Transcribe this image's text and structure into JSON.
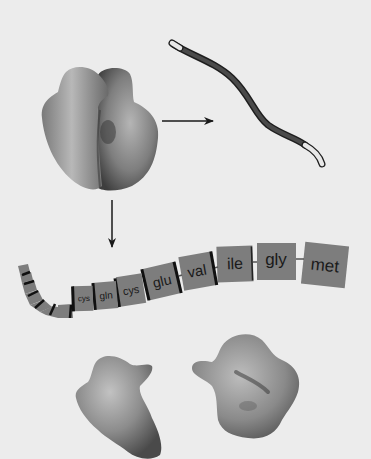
{
  "figure": {
    "colors": {
      "background": "#ececec",
      "blob_fill": "#8a8a8a",
      "strand_dark": "#2e2e2e",
      "strand_light": "#e6e6e6",
      "residue_box": "#7d7d7d",
      "residue_divider": "#111111",
      "arrow": "#1a1a1a"
    }
  },
  "elements": {
    "ribosome": {
      "name": "ribosome"
    },
    "mrna": {
      "name": "mRNA strand"
    },
    "arrow_right": {
      "name": "ribosome-to-mrna arrow"
    },
    "arrow_down": {
      "name": "ribosome-to-chain arrow"
    },
    "folded_proteins": [
      {
        "name": "folded protein 1"
      },
      {
        "name": "folded protein 2"
      }
    ]
  },
  "chain": {
    "residues": [
      {
        "label": "met"
      },
      {
        "label": "gly"
      },
      {
        "label": "ile"
      },
      {
        "label": "val"
      },
      {
        "label": "glu"
      },
      {
        "label": "cys"
      },
      {
        "label": "gln"
      },
      {
        "label": "cys"
      }
    ]
  }
}
